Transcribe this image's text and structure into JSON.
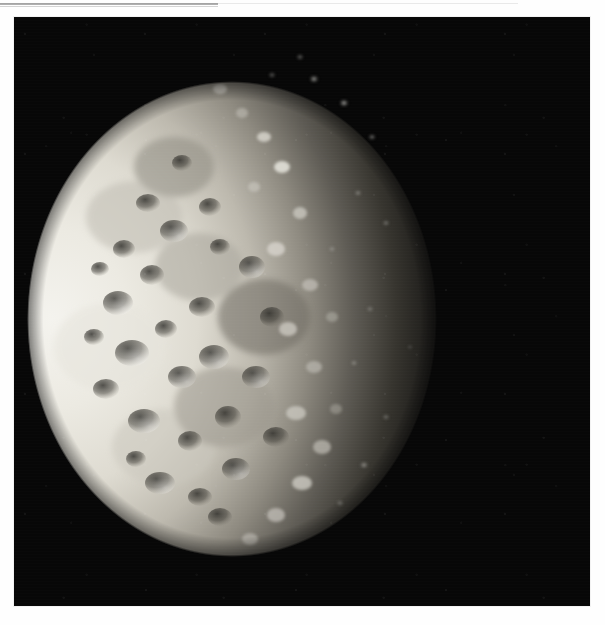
{
  "page": {
    "background_color": "#fdfdfd",
    "rule": {
      "name": "header-rule",
      "color": "#8f8f8f"
    }
  },
  "plate": {
    "name": "space-photograph",
    "alt_text": "",
    "frame": {
      "x": 14,
      "y": 17,
      "width": 576,
      "height": 589
    },
    "background_color": "#090909",
    "subject": "heavily cratered icy moon, crescent lit from the left",
    "illumination": "sunlight from left; terminator runs from upper-left to lower-right",
    "colors": {
      "space": "#070707",
      "limb_highlight": "#f0efe9",
      "sunlit_surface": "#d8d6cd",
      "midtone_surface": "#8d8a81",
      "shadow_surface": "#2a2825"
    }
  },
  "caption": {
    "text": ""
  }
}
